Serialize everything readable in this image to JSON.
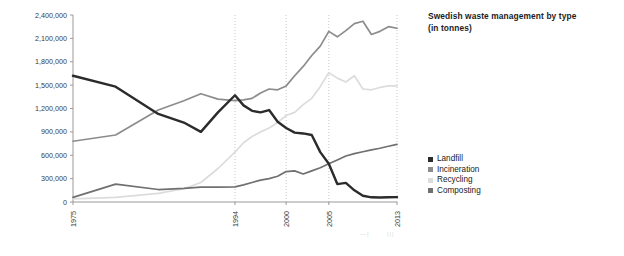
{
  "title": {
    "line1": "Swedish waste management by type",
    "line2": "(in tonnes)"
  },
  "legend": {
    "items": [
      {
        "label": "Landfill",
        "color": "#2b2b2b"
      },
      {
        "label": "Incineration",
        "color": "#8c8c8c"
      },
      {
        "label": "Recycling",
        "color": "#dcdcdc"
      },
      {
        "label": "Composting",
        "color": "#707070"
      }
    ]
  },
  "axes": {
    "y_ticks": [
      "0",
      "300,000",
      "600,000",
      "900,000",
      "1,200,000",
      "1,500,000",
      "1,800,000",
      "2,100,000",
      "2,400,000"
    ],
    "x_ticks": [
      "1975",
      "1994",
      "2000",
      "2005",
      "2013"
    ]
  },
  "footer_marks": {
    "mark_a": "—|",
    "mark_b": "|||"
  },
  "chart_data": {
    "type": "line",
    "title": "Swedish waste management by type (in tonnes)",
    "xlabel": "",
    "ylabel": "",
    "ylim": [
      0,
      2400000
    ],
    "xlim": [
      1975,
      2013
    ],
    "grid": true,
    "legend_position": "right",
    "x_tick_values": [
      1975,
      1994,
      2000,
      2005,
      2013
    ],
    "y_tick_values": [
      0,
      300000,
      600000,
      900000,
      1200000,
      1500000,
      1800000,
      2100000,
      2400000
    ],
    "x": [
      1975,
      1980,
      1985,
      1988,
      1990,
      1992,
      1994,
      1995,
      1996,
      1997,
      1998,
      1999,
      2000,
      2001,
      2002,
      2003,
      2004,
      2005,
      2006,
      2007,
      2008,
      2009,
      2010,
      2011,
      2012,
      2013
    ],
    "series": [
      {
        "name": "Landfill",
        "color": "#2b2b2b",
        "values": [
          1620000,
          1480000,
          1130000,
          1020000,
          900000,
          1150000,
          1370000,
          1240000,
          1170000,
          1150000,
          1180000,
          1030000,
          950000,
          890000,
          880000,
          860000,
          640000,
          490000,
          230000,
          245000,
          150000,
          80000,
          60000,
          58000,
          60000,
          62000
        ]
      },
      {
        "name": "Incineration",
        "color": "#8c8c8c",
        "values": [
          780000,
          860000,
          1180000,
          1300000,
          1390000,
          1320000,
          1300000,
          1310000,
          1330000,
          1400000,
          1450000,
          1440000,
          1490000,
          1620000,
          1740000,
          1880000,
          2000000,
          2190000,
          2120000,
          2200000,
          2290000,
          2320000,
          2150000,
          2190000,
          2250000,
          2230000
        ]
      },
      {
        "name": "Recycling",
        "color": "#dcdcdc",
        "values": [
          40000,
          60000,
          110000,
          170000,
          250000,
          430000,
          640000,
          760000,
          840000,
          900000,
          950000,
          1020000,
          1110000,
          1150000,
          1250000,
          1330000,
          1480000,
          1660000,
          1590000,
          1540000,
          1620000,
          1450000,
          1440000,
          1470000,
          1490000,
          1490000
        ]
      },
      {
        "name": "Composting",
        "color": "#707070",
        "values": [
          60000,
          230000,
          160000,
          175000,
          190000,
          190000,
          195000,
          220000,
          250000,
          280000,
          300000,
          330000,
          390000,
          400000,
          360000,
          400000,
          440000,
          490000,
          540000,
          590000,
          620000,
          645000,
          670000,
          690000,
          715000,
          740000
        ]
      }
    ]
  }
}
